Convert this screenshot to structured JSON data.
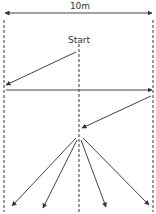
{
  "diagram": {
    "width_label": "10m",
    "start_label": "Start",
    "colors": {
      "line": "#444444",
      "dash": "#666666",
      "background": "#ffffff"
    },
    "boundaries": [
      {
        "name": "left-boundary",
        "x": 4,
        "y1": 20,
        "y2": 212
      },
      {
        "name": "center-line",
        "x": 79,
        "y1": 44,
        "y2": 212
      },
      {
        "name": "right-boundary",
        "x": 153,
        "y1": 20,
        "y2": 212
      }
    ],
    "dimension_arrow": {
      "x1": 5,
      "y1": 13,
      "x2": 152,
      "y2": 13
    },
    "path_arrows": [
      {
        "name": "diagonal-to-left",
        "x1": 76,
        "y1": 52,
        "x2": 6,
        "y2": 85
      },
      {
        "name": "horizontal-to-right",
        "x1": 6,
        "y1": 90,
        "x2": 152,
        "y2": 90
      },
      {
        "name": "diagonal-to-center",
        "x1": 151,
        "y1": 96,
        "x2": 82,
        "y2": 128
      },
      {
        "name": "fan-far-left",
        "x1": 76,
        "y1": 138,
        "x2": 12,
        "y2": 206
      },
      {
        "name": "fan-left",
        "x1": 77,
        "y1": 140,
        "x2": 43,
        "y2": 208
      },
      {
        "name": "fan-right",
        "x1": 81,
        "y1": 140,
        "x2": 106,
        "y2": 207
      },
      {
        "name": "fan-far-right",
        "x1": 83,
        "y1": 138,
        "x2": 149,
        "y2": 205
      }
    ]
  }
}
